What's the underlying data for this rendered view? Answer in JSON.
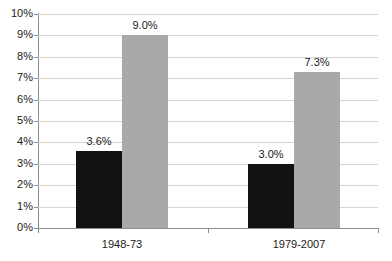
{
  "chart_data": {
    "type": "bar",
    "title": "",
    "subtitle": "",
    "xlabel": "",
    "ylabel": "",
    "categories": [
      "1948-73",
      "1979-2007"
    ],
    "series": [
      {
        "name": "series-1",
        "color": "#111111",
        "values": [
          3.6,
          3.0
        ],
        "labels": [
          "3.6%",
          "3.0%"
        ]
      },
      {
        "name": "series-2",
        "color": "#a9a9a9",
        "values": [
          9.0,
          7.3
        ],
        "labels": [
          "9.0%",
          "7.3%"
        ]
      }
    ],
    "ylim": [
      0,
      10
    ],
    "ytick_step": 1,
    "ytick_labels": [
      "0%",
      "1%",
      "2%",
      "3%",
      "4%",
      "5%",
      "6%",
      "7%",
      "8%",
      "9%",
      "10%"
    ],
    "grid": true,
    "grid_axis": "y",
    "legend": false,
    "legend_position": "none",
    "value_format": "percent",
    "background": "#ffffff",
    "gridline_color": "#d5d5d5",
    "axis_color": "#8c8c8c",
    "text_color": "#1a1a1a"
  }
}
